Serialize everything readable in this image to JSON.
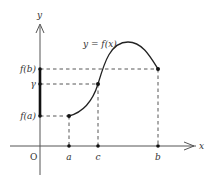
{
  "diagram": {
    "axes": {
      "x_label": "x",
      "y_label": "y",
      "origin_label": "O"
    },
    "curve_label": "y = f(x)",
    "x_ticks": [
      {
        "label": "a",
        "x": 69
      },
      {
        "label": "c",
        "x": 98
      },
      {
        "label": "b",
        "x": 158
      }
    ],
    "y_ticks": [
      {
        "label": "f(b)",
        "y": 69
      },
      {
        "label": "γ",
        "y": 84
      },
      {
        "label": "f(a)",
        "y": 116
      }
    ],
    "points": [
      {
        "name": "A",
        "x_label": "a",
        "y_label": "f(a)"
      },
      {
        "name": "C",
        "x_label": "c",
        "y_label": "γ"
      },
      {
        "name": "B",
        "x_label": "b",
        "y_label": "f(b)"
      }
    ],
    "colors": {
      "line": "#333333",
      "axis": "#555555",
      "highlight": "#111111"
    }
  }
}
